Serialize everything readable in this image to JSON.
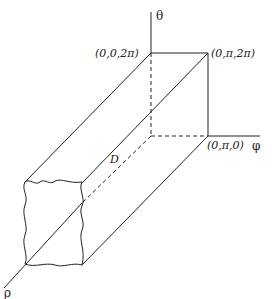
{
  "diagram": {
    "axes": {
      "theta": "θ",
      "phi": "φ",
      "rho": "ρ"
    },
    "points": {
      "top_back": "(0,0,2π)",
      "top_right": "(0,π,2π)",
      "bottom_right": "(0,π,0)"
    },
    "region_label": "D",
    "colors": {
      "line": "#222222",
      "background": "#ffffff"
    }
  }
}
